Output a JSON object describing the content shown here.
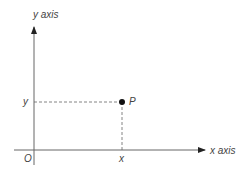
{
  "diagram": {
    "type": "cartesian-point",
    "y_axis_label": "y axis",
    "x_axis_label": "x axis",
    "origin_label": "O",
    "point_label": "P",
    "x_coord_label": "x",
    "y_coord_label": "y",
    "colors": {
      "axis": "#555555",
      "point": "#111111",
      "dash": "#666666"
    }
  }
}
